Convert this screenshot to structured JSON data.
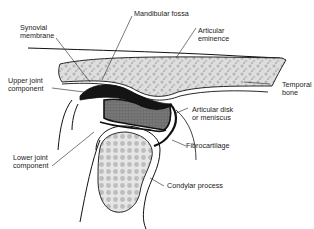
{
  "diagram": {
    "colors": {
      "outline": "#111111",
      "bone_fill": "#d9d9d9",
      "bone_speckle": "#a8a8a8",
      "disk_fill": "#7a7a7a",
      "joint_space": "#141414",
      "background": "#ffffff",
      "label_text": "#222222"
    },
    "labels": [
      {
        "id": "mandibular-fossa",
        "text": "Mandibular fossa"
      },
      {
        "id": "synovial-membrane",
        "text": "Synovial\nmembrane"
      },
      {
        "id": "articular-eminence",
        "text": "Articular\neminence"
      },
      {
        "id": "upper-joint-component",
        "text": "Upper joint\ncomponent"
      },
      {
        "id": "temporal-bone",
        "text": "Temporal\nbone"
      },
      {
        "id": "articular-disk",
        "text": "Articular disk\nor meniscus"
      },
      {
        "id": "lower-joint-component",
        "text": "Lower joint\ncomponent"
      },
      {
        "id": "fibrocartilage",
        "text": "Fibrocartilage"
      },
      {
        "id": "condylar-process",
        "text": "Condylar process"
      }
    ]
  }
}
